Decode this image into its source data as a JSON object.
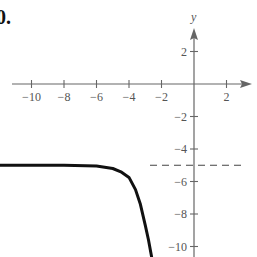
{
  "problem_number": "0.",
  "chart_data": {
    "type": "line",
    "title": "",
    "xlabel": "",
    "ylabel": "y",
    "xlim": [
      -12,
      3.8
    ],
    "ylim": [
      -10.8,
      5.2
    ],
    "x_ticks": [
      -10,
      -8,
      -6,
      -4,
      -2,
      2
    ],
    "x_tick_labels": [
      "−10",
      "−8",
      "−6",
      "−4",
      "−2",
      "2"
    ],
    "y_ticks": [
      2,
      -2,
      -4,
      -6,
      -8,
      -10
    ],
    "y_tick_labels": [
      "2",
      "−2",
      "−4",
      "−6",
      "−8",
      "−10"
    ],
    "asymptote": {
      "type": "horizontal",
      "y": -5,
      "style": "dashed"
    },
    "series": [
      {
        "name": "f(x)",
        "x": [
          -12,
          -10,
          -8,
          -6,
          -5,
          -4.5,
          -4,
          -3.6,
          -3.3,
          -3.0,
          -2.8,
          -2.6
        ],
        "y": [
          -5.0,
          -5.0,
          -5.0,
          -5.05,
          -5.2,
          -5.4,
          -5.75,
          -6.5,
          -7.4,
          -8.7,
          -9.6,
          -10.7
        ]
      }
    ],
    "grid": false,
    "legend": null
  },
  "axes": {
    "origin_px": [
      194,
      84
    ],
    "unit_px": 16.25
  }
}
